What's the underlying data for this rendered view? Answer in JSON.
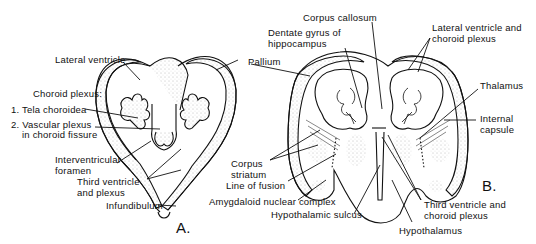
{
  "figure": {
    "panel_a": {
      "letter": "A.",
      "labels": {
        "lateral_ventricle": "Lateral ventricle",
        "choroid_plexus": "Choroid plexus:",
        "tela_choroidea": "1. Tela choroidea",
        "vascular_plexus_1": "2. Vascular plexus",
        "vascular_plexus_2": "in choroid fissure",
        "interventricular_1": "Interventricular",
        "interventricular_2": "foramen",
        "third_ventricle_1": "Third ventricle",
        "third_ventricle_2": "and plexus",
        "infundibulum": "Infundibulum",
        "pallium": "Pallium"
      }
    },
    "panel_b": {
      "letter": "B.",
      "labels": {
        "corpus_callosum": "Corpus callosum",
        "dentate_1": "Dentate gyrus of",
        "dentate_2": "hippocampus",
        "lateral_ventricle_1": "Lateral ventricle and",
        "lateral_ventricle_2": "choroid plexus",
        "thalamus": "Thalamus",
        "internal_capsule_1": "Internal",
        "internal_capsule_2": "capsule",
        "corpus_striatum_1": "Corpus",
        "corpus_striatum_2": "striatum",
        "line_of_fusion": "Line of fusion",
        "amygdaloid": "Amygdaloid nuclear complex",
        "hypothalamic_sulcus": "Hypothalamic sulcus",
        "third_ventricle_1": "Third ventricle and",
        "third_ventricle_2": "choroid plexus",
        "hypothalamus": "Hypothalamus"
      }
    }
  }
}
